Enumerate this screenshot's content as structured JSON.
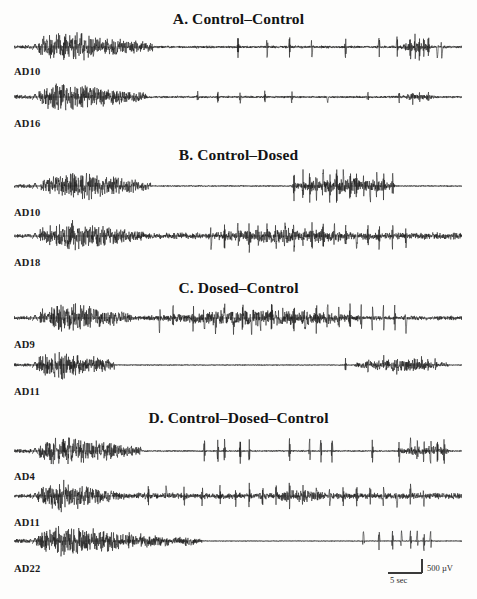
{
  "figure": {
    "kind": "electrophysiology-trace-figure",
    "background": "#fdfdfc",
    "ink": "#141414",
    "width": 477,
    "height": 599
  },
  "panels": [
    {
      "id": "A",
      "title": "A. Control–Control",
      "title_y": 10,
      "traces": [
        {
          "label": "AD10",
          "baseline_y": 47,
          "label_y": 66,
          "marker": "^",
          "seed": 1011,
          "burst_start": 0.055,
          "burst_peak": 0.1,
          "burst_end": 0.31,
          "burst_amp": 1.0,
          "tail_amp": 0.085,
          "spikes": [
            0.5,
            0.565,
            0.615,
            0.665,
            0.74,
            0.815,
            0.855,
            0.885,
            0.895,
            0.905,
            0.915,
            0.925,
            0.945,
            0.955
          ],
          "spike_amp": 0.5,
          "late_cluster": [
            0.855,
            0.935
          ],
          "late_cluster_amp": 0.34
        },
        {
          "label": "AD16",
          "baseline_y": 97,
          "label_y": 118,
          "marker": "^",
          "seed": 1016,
          "burst_start": 0.055,
          "burst_peak": 0.105,
          "burst_end": 0.295,
          "burst_amp": 0.92,
          "tail_amp": 0.075,
          "spikes": [
            0.41,
            0.455,
            0.505,
            0.56,
            0.62,
            0.7,
            0.79,
            0.86,
            0.89,
            0.905,
            0.925
          ],
          "spike_amp": 0.26,
          "late_cluster": [
            0.855,
            0.94
          ],
          "late_cluster_amp": 0.22
        }
      ]
    },
    {
      "id": "B",
      "title": "B. Control–Dosed",
      "title_y": 146,
      "traces": [
        {
          "label": "AD10",
          "baseline_y": 186,
          "label_y": 207,
          "marker": "^",
          "seed": 2010,
          "burst_start": 0.06,
          "burst_peak": 0.16,
          "burst_end": 0.305,
          "burst_amp": 0.9,
          "tail_amp": 0.045,
          "spikes": [
            0.625,
            0.645,
            0.66,
            0.675,
            0.69,
            0.705,
            0.72,
            0.735,
            0.75,
            0.765,
            0.78,
            0.795,
            0.81,
            0.825,
            0.845
          ],
          "spike_amp": 0.62,
          "late_cluster": [
            0.62,
            0.85
          ],
          "late_cluster_amp": 0.55
        },
        {
          "label": "AD18",
          "baseline_y": 236,
          "label_y": 257,
          "marker": "^",
          "seed": 2018,
          "burst_start": 0.055,
          "burst_peak": 0.135,
          "burst_end": 0.29,
          "burst_amp": 0.95,
          "tail_amp": 0.22,
          "spikes": [
            0.44,
            0.47,
            0.5,
            0.525,
            0.545,
            0.565,
            0.585,
            0.605,
            0.625,
            0.645,
            0.665,
            0.69,
            0.715,
            0.74,
            0.765,
            0.79,
            0.815,
            0.845,
            0.875
          ],
          "spike_amp": 0.56,
          "late_cluster": [
            0.43,
            0.8
          ],
          "late_cluster_amp": 0.48
        }
      ]
    },
    {
      "id": "C",
      "title": "C. Dosed–Control",
      "title_y": 279,
      "traces": [
        {
          "label": "AD9",
          "baseline_y": 318,
          "label_y": 339,
          "marker": "^",
          "seed": 3009,
          "burst_start": 0.055,
          "burst_peak": 0.12,
          "burst_end": 0.265,
          "burst_amp": 1.0,
          "tail_amp": 0.14,
          "spikes": [
            0.325,
            0.355,
            0.4,
            0.425,
            0.45,
            0.47,
            0.49,
            0.51,
            0.53,
            0.55,
            0.575,
            0.6,
            0.625,
            0.65,
            0.675,
            0.7,
            0.725,
            0.75,
            0.775,
            0.8,
            0.825,
            0.85,
            0.875
          ],
          "spike_amp": 0.62,
          "late_cluster": [
            0.3,
            0.78
          ],
          "late_cluster_amp": 0.5
        },
        {
          "label": "AD11",
          "baseline_y": 365,
          "label_y": 386,
          "marker": "^",
          "seed": 3011,
          "burst_start": 0.05,
          "burst_peak": 0.095,
          "burst_end": 0.225,
          "burst_amp": 0.98,
          "tail_amp": 0.035,
          "spikes": [
            0.74,
            0.79,
            0.825,
            0.855,
            0.875,
            0.895,
            0.91,
            0.925,
            0.94
          ],
          "spike_amp": 0.3,
          "late_cluster": [
            0.76,
            0.97
          ],
          "late_cluster_amp": 0.4
        }
      ]
    },
    {
      "id": "D",
      "title": "D. Control–Dosed–Control",
      "title_y": 409,
      "traces": [
        {
          "label": "AD4",
          "baseline_y": 451,
          "label_y": 471,
          "marker": "^",
          "seed": 4004,
          "burst_start": 0.055,
          "burst_peak": 0.115,
          "burst_end": 0.285,
          "burst_amp": 0.98,
          "tail_amp": 0.05,
          "spikes": [
            0.425,
            0.455,
            0.47,
            0.505,
            0.525,
            0.615,
            0.66,
            0.685,
            0.71,
            0.8,
            0.86,
            0.885,
            0.9,
            0.915,
            0.93,
            0.945,
            0.96
          ],
          "spike_amp": 0.55,
          "late_cluster": [
            0.86,
            0.97
          ],
          "late_cluster_amp": 0.4
        },
        {
          "label": "AD11",
          "baseline_y": 496,
          "label_y": 517,
          "marker": "^",
          "seed": 4011,
          "burst_start": 0.05,
          "burst_peak": 0.105,
          "burst_end": 0.245,
          "burst_amp": 0.96,
          "tail_amp": 0.2,
          "spikes": [
            0.3,
            0.34,
            0.38,
            0.42,
            0.46,
            0.495,
            0.525,
            0.555,
            0.585,
            0.615,
            0.645,
            0.675,
            0.705,
            0.735,
            0.765,
            0.795,
            0.825,
            0.855,
            0.885,
            0.915
          ],
          "spike_amp": 0.46,
          "late_cluster": [
            0.575,
            0.7
          ],
          "late_cluster_amp": 0.44
        },
        {
          "label": "AD22",
          "baseline_y": 541,
          "label_y": 563,
          "marker": "^",
          "seed": 4022,
          "burst_start": 0.05,
          "burst_peak": 0.11,
          "burst_end": 0.345,
          "burst_amp": 1.0,
          "tail_amp": 0.03,
          "spikes": [
            0.78,
            0.815,
            0.845,
            0.865,
            0.885,
            0.9,
            0.915,
            0.93
          ],
          "spike_amp": 0.46,
          "late_cluster": [
            0.34,
            0.42
          ],
          "late_cluster_amp": 0.3
        }
      ]
    }
  ],
  "trace_geometry": {
    "left": 14,
    "width": 448,
    "half_height": 17,
    "stroke": "#161616",
    "stroke_width": 0.55,
    "pre_baseline_end": 0.038,
    "marker_x": 0.047
  },
  "scalebar": {
    "left": 388,
    "top": 556,
    "voltage_label": "500 µV",
    "time_label": "5 sec"
  }
}
